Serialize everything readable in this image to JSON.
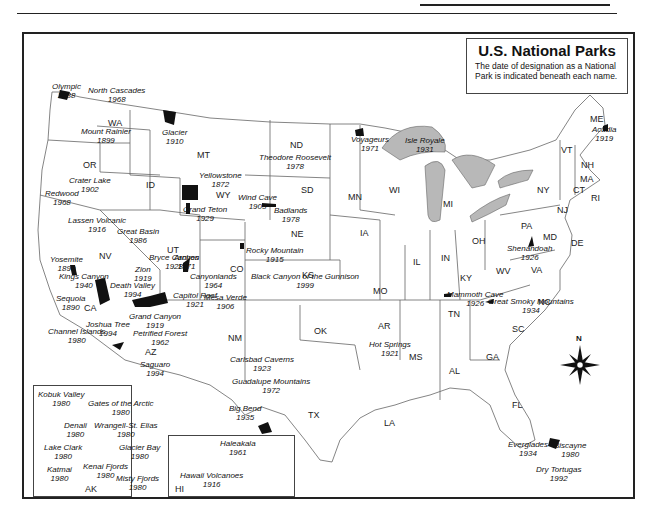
{
  "header": {
    "running_head": "NATIONAL PARKS"
  },
  "title_box": {
    "title": "U.S. National Parks",
    "subtitle": "The date of designation as a National Park is indicated beneath each name."
  },
  "states": [
    {
      "abbr": "WA",
      "x": 108,
      "y": 118
    },
    {
      "abbr": "OR",
      "x": 83,
      "y": 160
    },
    {
      "abbr": "ID",
      "x": 146,
      "y": 180
    },
    {
      "abbr": "MT",
      "x": 197,
      "y": 150
    },
    {
      "abbr": "WY",
      "x": 216,
      "y": 190
    },
    {
      "abbr": "ND",
      "x": 290,
      "y": 140
    },
    {
      "abbr": "SD",
      "x": 301,
      "y": 185
    },
    {
      "abbr": "NE",
      "x": 291,
      "y": 229
    },
    {
      "abbr": "MN",
      "x": 348,
      "y": 192
    },
    {
      "abbr": "IA",
      "x": 360,
      "y": 228
    },
    {
      "abbr": "WI",
      "x": 389,
      "y": 185
    },
    {
      "abbr": "MI",
      "x": 443,
      "y": 199
    },
    {
      "abbr": "NV",
      "x": 99,
      "y": 251
    },
    {
      "abbr": "UT",
      "x": 167,
      "y": 245
    },
    {
      "abbr": "CO",
      "x": 230,
      "y": 264
    },
    {
      "abbr": "KS",
      "x": 302,
      "y": 270
    },
    {
      "abbr": "MO",
      "x": 373,
      "y": 286
    },
    {
      "abbr": "IL",
      "x": 413,
      "y": 257
    },
    {
      "abbr": "IN",
      "x": 441,
      "y": 253
    },
    {
      "abbr": "OH",
      "x": 472,
      "y": 236
    },
    {
      "abbr": "PA",
      "x": 521,
      "y": 221
    },
    {
      "abbr": "NY",
      "x": 537,
      "y": 185
    },
    {
      "abbr": "CA",
      "x": 84,
      "y": 303
    },
    {
      "abbr": "AZ",
      "x": 145,
      "y": 347
    },
    {
      "abbr": "NM",
      "x": 228,
      "y": 333
    },
    {
      "abbr": "OK",
      "x": 314,
      "y": 326
    },
    {
      "abbr": "TX",
      "x": 308,
      "y": 410
    },
    {
      "abbr": "AR",
      "x": 378,
      "y": 321
    },
    {
      "abbr": "LA",
      "x": 384,
      "y": 418
    },
    {
      "abbr": "MS",
      "x": 409,
      "y": 352
    },
    {
      "abbr": "AL",
      "x": 449,
      "y": 366
    },
    {
      "abbr": "GA",
      "x": 486,
      "y": 352
    },
    {
      "abbr": "SC",
      "x": 512,
      "y": 324
    },
    {
      "abbr": "NC",
      "x": 538,
      "y": 297
    },
    {
      "abbr": "TN",
      "x": 448,
      "y": 309
    },
    {
      "abbr": "KY",
      "x": 460,
      "y": 273
    },
    {
      "abbr": "WV",
      "x": 496,
      "y": 266
    },
    {
      "abbr": "VA",
      "x": 531,
      "y": 265
    },
    {
      "abbr": "MD",
      "x": 543,
      "y": 232
    },
    {
      "abbr": "DE",
      "x": 571,
      "y": 238
    },
    {
      "abbr": "NJ",
      "x": 557,
      "y": 205
    },
    {
      "abbr": "CT",
      "x": 573,
      "y": 185
    },
    {
      "abbr": "RI",
      "x": 591,
      "y": 193
    },
    {
      "abbr": "MA",
      "x": 580,
      "y": 174
    },
    {
      "abbr": "NH",
      "x": 581,
      "y": 160
    },
    {
      "abbr": "VT",
      "x": 561,
      "y": 145
    },
    {
      "abbr": "ME",
      "x": 590,
      "y": 114
    },
    {
      "abbr": "FL",
      "x": 512,
      "y": 400
    },
    {
      "abbr": "AK",
      "x": 85,
      "y": 484
    },
    {
      "abbr": "HI",
      "x": 175,
      "y": 484
    }
  ],
  "parks": [
    {
      "name": "Olympic",
      "year": "1938",
      "x": 52,
      "y": 83
    },
    {
      "name": "North Cascades",
      "year": "1968",
      "x": 88,
      "y": 87
    },
    {
      "name": "Mount Rainier",
      "year": "1899",
      "x": 81,
      "y": 128
    },
    {
      "name": "Glacier",
      "year": "1910",
      "x": 162,
      "y": 129
    },
    {
      "name": "Crater Lake",
      "year": "1902",
      "x": 69,
      "y": 177
    },
    {
      "name": "Yellowstone",
      "year": "1872",
      "x": 199,
      "y": 172
    },
    {
      "name": "Redwood",
      "year": "1968",
      "x": 45,
      "y": 190
    },
    {
      "name": "Grand Teton",
      "year": "1929",
      "x": 183,
      "y": 206
    },
    {
      "name": "Theodore Roosevelt",
      "year": "1978",
      "x": 259,
      "y": 154
    },
    {
      "name": "Voyageurs",
      "year": "1971",
      "x": 351,
      "y": 136
    },
    {
      "name": "Isle Royale",
      "year": "1931",
      "x": 405,
      "y": 137
    },
    {
      "name": "Acadia",
      "year": "1919",
      "x": 592,
      "y": 126
    },
    {
      "name": "Wind Cave",
      "year": "1903",
      "x": 238,
      "y": 194
    },
    {
      "name": "Badlands",
      "year": "1978",
      "x": 274,
      "y": 207
    },
    {
      "name": "Lassen Volcanic",
      "year": "1916",
      "x": 68,
      "y": 217
    },
    {
      "name": "Great Basin",
      "year": "1986",
      "x": 117,
      "y": 228
    },
    {
      "name": "Yosemite",
      "year": "1890",
      "x": 50,
      "y": 256
    },
    {
      "name": "Bryce Canyon",
      "year": "1928",
      "x": 149,
      "y": 254
    },
    {
      "name": "Arches",
      "year": "1971",
      "x": 174,
      "y": 254
    },
    {
      "name": "Zion",
      "year": "1919",
      "x": 134,
      "y": 266
    },
    {
      "name": "Rocky Mountain",
      "year": "1915",
      "x": 246,
      "y": 247
    },
    {
      "name": "Canyonlands",
      "year": "1964",
      "x": 190,
      "y": 273
    },
    {
      "name": "Black Canyon of the Gunnison",
      "year": "1999",
      "x": 251,
      "y": 273
    },
    {
      "name": "Kings Canyon",
      "year": "1940",
      "x": 59,
      "y": 273
    },
    {
      "name": "Death Valley",
      "year": "1994",
      "x": 110,
      "y": 282
    },
    {
      "name": "Capitol Reef",
      "year": "1921",
      "x": 173,
      "y": 292
    },
    {
      "name": "Mesa Verde",
      "year": "1906",
      "x": 204,
      "y": 294
    },
    {
      "name": "Sequoia",
      "year": "1890",
      "x": 56,
      "y": 295
    },
    {
      "name": "Shenandoah",
      "year": "1926",
      "x": 507,
      "y": 245
    },
    {
      "name": "Mammoth Cave",
      "year": "1926",
      "x": 447,
      "y": 291
    },
    {
      "name": "Great Smoky Mountains",
      "year": "1934",
      "x": 488,
      "y": 298
    },
    {
      "name": "Grand Canyon",
      "year": "1919",
      "x": 129,
      "y": 313
    },
    {
      "name": "Joshua Tree",
      "year": "1994",
      "x": 86,
      "y": 321
    },
    {
      "name": "Channel Islands",
      "year": "1980",
      "x": 48,
      "y": 328
    },
    {
      "name": "Petrified Forest",
      "year": "1962",
      "x": 133,
      "y": 330
    },
    {
      "name": "Saguaro",
      "year": "1994",
      "x": 140,
      "y": 361
    },
    {
      "name": "Carlsbad Caverns",
      "year": "1923",
      "x": 230,
      "y": 356
    },
    {
      "name": "Hot Springs",
      "year": "1921",
      "x": 369,
      "y": 341
    },
    {
      "name": "Guadalupe Mountains",
      "year": "1972",
      "x": 232,
      "y": 378
    },
    {
      "name": "Big Bend",
      "year": "1935",
      "x": 229,
      "y": 405
    },
    {
      "name": "Everglades",
      "year": "1934",
      "x": 508,
      "y": 441
    },
    {
      "name": "Biscayne",
      "year": "1980",
      "x": 554,
      "y": 442
    },
    {
      "name": "Dry Tortugas",
      "year": "1992",
      "x": 536,
      "y": 466
    }
  ],
  "alaska_parks": [
    {
      "name": "Kobuk Valley",
      "year": "1980",
      "x": 38,
      "y": 391
    },
    {
      "name": "Gates of the Arctic",
      "year": "1980",
      "x": 88,
      "y": 400
    },
    {
      "name": "Denali",
      "year": "1980",
      "x": 64,
      "y": 422
    },
    {
      "name": "Wrangell-St. Elias",
      "year": "1980",
      "x": 94,
      "y": 422
    },
    {
      "name": "Lake Clark",
      "year": "1980",
      "x": 44,
      "y": 444
    },
    {
      "name": "Glacier Bay",
      "year": "1980",
      "x": 119,
      "y": 444
    },
    {
      "name": "Kenai Fjords",
      "year": "1980",
      "x": 83,
      "y": 463
    },
    {
      "name": "Katmai",
      "year": "1980",
      "x": 47,
      "y": 466
    },
    {
      "name": "Misty Fjords",
      "year": "1980",
      "x": 116,
      "y": 475
    }
  ],
  "hawaii_parks": [
    {
      "name": "Haleakala",
      "year": "1961",
      "x": 220,
      "y": 440
    },
    {
      "name": "Hawaii Volcanoes",
      "year": "1916",
      "x": 180,
      "y": 472
    }
  ],
  "compass": {
    "label": "N"
  },
  "colors": {
    "water": "#b8b8b8",
    "park": "#111111",
    "line": "#555555",
    "frame": "#222222"
  }
}
